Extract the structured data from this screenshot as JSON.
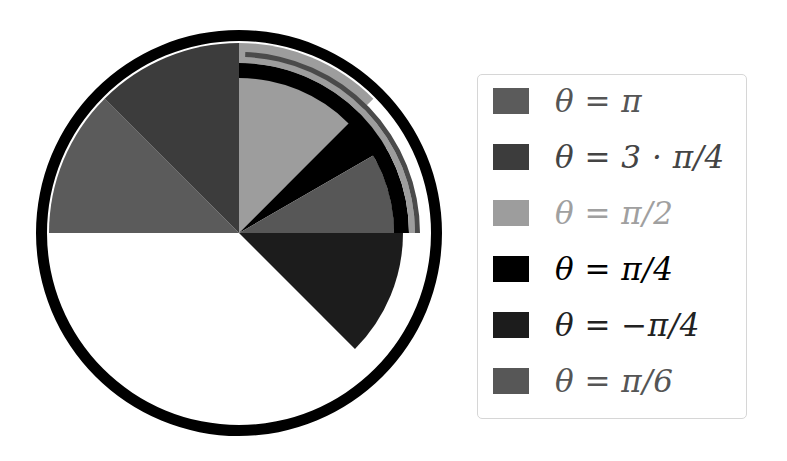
{
  "chart_data": {
    "type": "pie",
    "title": "",
    "center": [
      239,
      233
    ],
    "outer_ring": {
      "inner_radius": 192,
      "outer_radius": 203,
      "color": "#000000"
    },
    "legend_position": "right",
    "series": [
      {
        "name": "θ = π",
        "theta_label": "π",
        "start_deg": 135,
        "end_deg": 180,
        "radius": 190,
        "color": "#5b5b5b"
      },
      {
        "name": "θ = 3 · π/4",
        "theta_label": "3·π/4",
        "start_deg": 90,
        "end_deg": 135,
        "radius": 190,
        "color": "#3c3c3c"
      },
      {
        "name": "θ = π/2",
        "theta_label": "π/2",
        "start_deg": 45,
        "end_deg": 90,
        "radius": 190,
        "color": "#9d9d9d"
      },
      {
        "name": "θ = π/4",
        "theta_label": "π/4",
        "start_deg": 30,
        "end_deg": 45,
        "radius": 171,
        "color": "#000000"
      },
      {
        "name": "θ = −π/4",
        "theta_label": "−π/4",
        "start_deg": -45,
        "end_deg": 0,
        "radius": 164,
        "color": "#1c1c1c"
      },
      {
        "name": "θ = π/6",
        "theta_label": "π/6",
        "start_deg": 0,
        "end_deg": 30,
        "radius": 155,
        "color": "#575757"
      }
    ],
    "thin_arcs": [
      {
        "start_deg": 0,
        "end_deg": 90,
        "r_inner": 155,
        "r_outer": 170,
        "color": "#000000"
      },
      {
        "start_deg": 0,
        "end_deg": 88,
        "r_inner": 170,
        "r_outer": 176,
        "color": "#9d9d9d"
      },
      {
        "start_deg": 0,
        "end_deg": 88,
        "r_inner": 176,
        "r_outer": 181,
        "color": "#4a4a4a"
      }
    ]
  },
  "legend": {
    "items": [
      {
        "label": "θ = π",
        "color": "#5b5b5b",
        "text_color": "#555555"
      },
      {
        "label": "θ = 3 · π/4",
        "color": "#3c3c3c",
        "text_color": "#444444"
      },
      {
        "label": "θ = π/2",
        "color": "#9d9d9d",
        "text_color": "#a0a0a0"
      },
      {
        "label": "θ = π/4",
        "color": "#000000",
        "text_color": "#000000"
      },
      {
        "label": "θ = −π/4",
        "color": "#1c1c1c",
        "text_color": "#222222"
      },
      {
        "label": "θ = π/6",
        "color": "#575757",
        "text_color": "#555555"
      }
    ]
  }
}
